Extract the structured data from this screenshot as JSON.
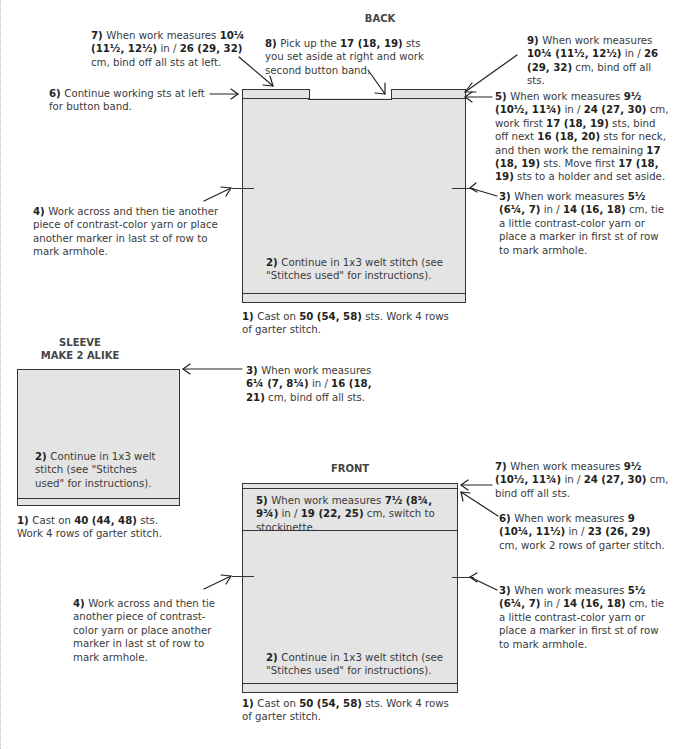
{
  "back": {
    "title": "BACK",
    "steps": {
      "s1": {
        "num": "1)",
        "parts": [
          [
            "Cast on ",
            false
          ],
          [
            "50 (54, 58)",
            true
          ],
          [
            " sts. Work 4 rows of garter stitch.",
            false
          ]
        ]
      },
      "s2": {
        "num": "2)",
        "parts": [
          [
            "Continue in 1x3 welt stitch (see \"Stitches used\" for instructions).",
            false
          ]
        ]
      },
      "s3": {
        "num": "3)",
        "parts": [
          [
            "When work measures ",
            false
          ],
          [
            "5½ (6¼, 7)",
            true
          ],
          [
            " in / ",
            false
          ],
          [
            "14 (16, 18)",
            true
          ],
          [
            " cm, tie a little contrast-color yarn or place a marker in first st of row to mark armhole.",
            false
          ]
        ]
      },
      "s4": {
        "num": "4)",
        "parts": [
          [
            "Work across and then tie another piece of contrast-color yarn or place another marker in last st of row to mark armhole.",
            false
          ]
        ]
      },
      "s5": {
        "num": "5)",
        "parts": [
          [
            "When work measures ",
            false
          ],
          [
            "9½ (10½, 11¾)",
            true
          ],
          [
            " in / ",
            false
          ],
          [
            "24 (27, 30)",
            true
          ],
          [
            " cm, work first ",
            false
          ],
          [
            "17 (18, 19)",
            true
          ],
          [
            " sts, bind off next ",
            false
          ],
          [
            "16 (18, 20)",
            true
          ],
          [
            " sts for neck, and then work the remaining ",
            false
          ],
          [
            "17 (18, 19)",
            true
          ],
          [
            " sts. Move first ",
            false
          ],
          [
            "17 (18, 19)",
            true
          ],
          [
            " sts to a holder and set aside.",
            false
          ]
        ]
      },
      "s6": {
        "num": "6)",
        "parts": [
          [
            "Continue working sts at left for button band.",
            false
          ]
        ]
      },
      "s7": {
        "num": "7)",
        "parts": [
          [
            "When work measures ",
            false
          ],
          [
            "10¼ (11½, 12½)",
            true
          ],
          [
            " in / ",
            false
          ],
          [
            "26 (29, 32)",
            true
          ],
          [
            " cm, bind off all sts at left.",
            false
          ]
        ]
      },
      "s8": {
        "num": "8)",
        "parts": [
          [
            "Pick up the ",
            false
          ],
          [
            "17 (18, 19)",
            true
          ],
          [
            " sts you set aside at right and work second button band.",
            false
          ]
        ]
      },
      "s9": {
        "num": "9)",
        "parts": [
          [
            "When work measures ",
            false
          ],
          [
            "10¼ (11½, 12½)",
            true
          ],
          [
            " in / ",
            false
          ],
          [
            "26 (29, 32)",
            true
          ],
          [
            " cm, bind off all sts.",
            false
          ]
        ]
      }
    }
  },
  "sleeve": {
    "title": "SLEEVE",
    "subtitle": "MAKE 2 ALIKE",
    "steps": {
      "s1": {
        "num": "1)",
        "parts": [
          [
            "Cast on ",
            false
          ],
          [
            "40 (44, 48)",
            true
          ],
          [
            " sts. Work 4 rows of garter stitch.",
            false
          ]
        ]
      },
      "s2": {
        "num": "2)",
        "parts": [
          [
            "Continue in 1x3 welt stitch (see \"Stitches used\" for instructions).",
            false
          ]
        ]
      },
      "s3": {
        "num": "3)",
        "parts": [
          [
            "When work measures ",
            false
          ],
          [
            "6¼ (7, 8¼)",
            true
          ],
          [
            " in / ",
            false
          ],
          [
            "16 (18, 21)",
            true
          ],
          [
            " cm, bind off all sts.",
            false
          ]
        ]
      }
    }
  },
  "front": {
    "title": "FRONT",
    "steps": {
      "s1": {
        "num": "1)",
        "parts": [
          [
            "Cast on ",
            false
          ],
          [
            "50 (54, 58)",
            true
          ],
          [
            " sts. Work 4 rows of garter stitch.",
            false
          ]
        ]
      },
      "s2": {
        "num": "2)",
        "parts": [
          [
            "Continue in 1x3 welt stitch (see \"Stitches used\" for instructions).",
            false
          ]
        ]
      },
      "s3": {
        "num": "3)",
        "parts": [
          [
            "When work measures ",
            false
          ],
          [
            "5½ (6¼, 7)",
            true
          ],
          [
            " in / ",
            false
          ],
          [
            "14 (16, 18)",
            true
          ],
          [
            " cm, tie a little contrast-color yarn or place a marker in first st of row to mark armhole.",
            false
          ]
        ]
      },
      "s4": {
        "num": "4)",
        "parts": [
          [
            "Work across and then tie another piece of contrast-color yarn or place another marker in last st of row to mark armhole.",
            false
          ]
        ]
      },
      "s5": {
        "num": "5)",
        "parts": [
          [
            "When work measures ",
            false
          ],
          [
            "7½ (8¾, 9¾)",
            true
          ],
          [
            " in / ",
            false
          ],
          [
            "19 (22, 25)",
            true
          ],
          [
            " cm, switch to stockinette.",
            false
          ]
        ]
      },
      "s6": {
        "num": "6)",
        "parts": [
          [
            "When work measures ",
            false
          ],
          [
            "9 (10¼, 11½)",
            true
          ],
          [
            " in / ",
            false
          ],
          [
            "23 (26, 29)",
            true
          ],
          [
            " cm, work 2 rows of garter stitch.",
            false
          ]
        ]
      },
      "s7": {
        "num": "7)",
        "parts": [
          [
            "When work measures ",
            false
          ],
          [
            "9½ (10½, 11¾)",
            true
          ],
          [
            " in / ",
            false
          ],
          [
            "24 (27, 30)",
            true
          ],
          [
            " cm, bind off all sts.",
            false
          ]
        ]
      }
    }
  },
  "colors": {
    "piece_fill": "#e4e4e4",
    "outline": "#333333",
    "text": "#3a3a3a"
  }
}
